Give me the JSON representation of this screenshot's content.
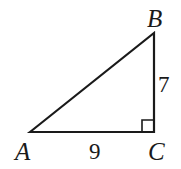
{
  "diagram": {
    "type": "right-triangle",
    "stroke_color": "#1a1a1a",
    "vertices": {
      "A": {
        "label": "A",
        "x": 30,
        "y": 132
      },
      "B": {
        "label": "B",
        "x": 154,
        "y": 33
      },
      "C": {
        "label": "C",
        "x": 154,
        "y": 132
      }
    },
    "sides": {
      "AC": {
        "label": "9"
      },
      "BC": {
        "label": "7"
      }
    },
    "right_angle_at": "C"
  }
}
